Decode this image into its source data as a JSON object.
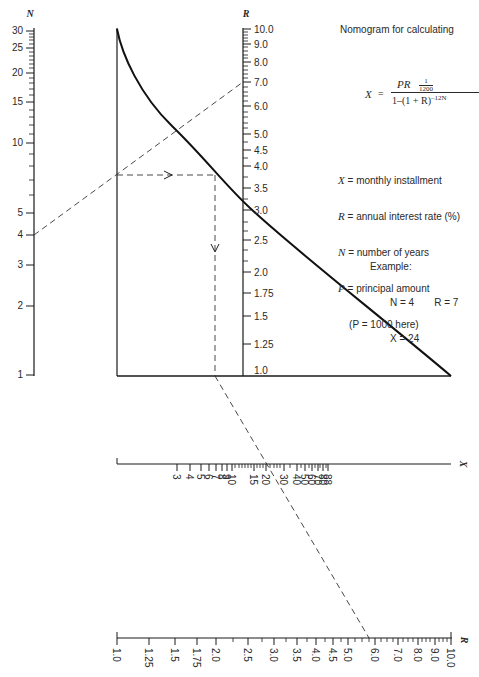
{
  "title": "Nomogram for calculating",
  "formula": {
    "lhs": "X",
    "eq": "=",
    "numerator": "PR",
    "numerator_fraction_num": "1",
    "numerator_fraction_den": "1200",
    "denominator": "1–(1 + R)",
    "denominator_exponent": "–12N"
  },
  "legend": [
    {
      "sym": "X",
      "text": "= monthly installment"
    },
    {
      "sym": "R",
      "text": "= annual interest rate (%)"
    },
    {
      "sym": "N",
      "text": "= number of years"
    },
    {
      "sym": "P",
      "text": "= principal amount"
    },
    {
      "sym": "",
      "text": "    (P = 1000 here)"
    }
  ],
  "example": {
    "heading": "Example:",
    "line1_n": "N = 4",
    "line1_r": "R = 7",
    "line2_x": "X = 24"
  },
  "axes": {
    "n_axis": {
      "name": "N",
      "labels": [
        "30",
        "25",
        "20",
        "15",
        "10",
        "5",
        "4",
        "3",
        "2",
        "1"
      ]
    },
    "r_axis_vertical": {
      "name": "R",
      "labels": [
        "10.0",
        "9.0",
        "8.0",
        "7.0",
        "6.0",
        "5.0",
        "4.5",
        "4.0",
        "3.5",
        "3.0",
        "2.5",
        "2.0",
        "1.75",
        "1.5",
        "1.25",
        "1.0"
      ]
    },
    "x_axis": {
      "name": "X",
      "labels": [
        "3",
        "4",
        "5",
        "6",
        "7",
        "8",
        "9",
        "10",
        "15",
        "20",
        "30",
        "40",
        "50",
        "60",
        "70",
        "80",
        "88"
      ]
    },
    "r_axis_horizontal": {
      "name": "R",
      "labels": [
        "1.0",
        "1.25",
        "1.5",
        "1.75",
        "2.0",
        "2.5",
        "3.0",
        "3.5",
        "4.0",
        "4.5",
        "5.0",
        "6.0",
        "7.0",
        "8.0",
        "9.0",
        "10.0"
      ]
    }
  },
  "colors": {
    "ink": "#1a1a1a",
    "background": "#ffffff"
  }
}
